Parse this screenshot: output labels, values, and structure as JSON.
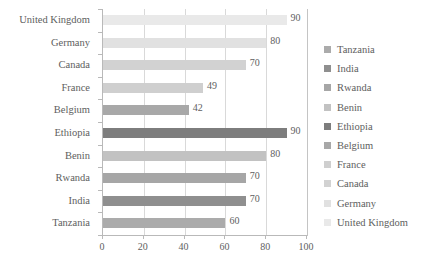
{
  "chart_data": {
    "type": "bar",
    "orientation": "horizontal",
    "title": "",
    "xlabel": "",
    "ylabel": "",
    "xlim": [
      0,
      100
    ],
    "xticks": [
      0,
      20,
      40,
      60,
      80,
      100
    ],
    "grid": true,
    "legend_position": "right",
    "categories": [
      "United Kingdom",
      "Germany",
      "Canada",
      "France",
      "Belgium",
      "Ethiopia",
      "Benin",
      "Rwanda",
      "India",
      "Tanzania"
    ],
    "values": [
      90,
      80,
      70,
      49,
      42,
      90,
      80,
      70,
      70,
      60
    ],
    "value_labels": [
      "90",
      "80",
      "70",
      "49",
      "42",
      "90",
      "80",
      "70",
      "70",
      "60"
    ],
    "colors": [
      "#e9e9e9",
      "#e1e1e1",
      "#d2d2d2",
      "#cfcfcf",
      "#a8a8a8",
      "#7d7d7d",
      "#c2c2c2",
      "#a6a6a6",
      "#8f8f8f",
      "#ababab"
    ],
    "legend": [
      {
        "label": "Tanzania",
        "color": "#ababab"
      },
      {
        "label": "India",
        "color": "#8f8f8f"
      },
      {
        "label": "Rwanda",
        "color": "#a6a6a6"
      },
      {
        "label": "Benin",
        "color": "#c2c2c2"
      },
      {
        "label": "Ethiopia",
        "color": "#7d7d7d"
      },
      {
        "label": "Belgium",
        "color": "#a8a8a8"
      },
      {
        "label": "France",
        "color": "#cfcfcf"
      },
      {
        "label": "Canada",
        "color": "#d2d2d2"
      },
      {
        "label": "Germany",
        "color": "#e1e1e1"
      },
      {
        "label": "United Kingdom",
        "color": "#e9e9e9"
      }
    ],
    "axis_color": "#b9b9b9",
    "gridline_color": "#d9d9d9",
    "text_color": "#5e5e5e"
  }
}
